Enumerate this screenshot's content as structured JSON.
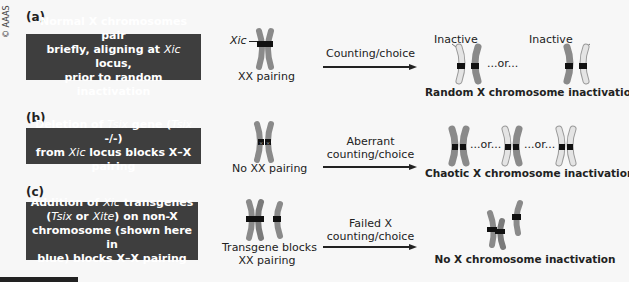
{
  "copyright": "© AAAS",
  "colors": {
    "box_bg": "#3e3e3e",
    "chromosome_dark": "#8a8a8a",
    "chromosome_light": "#e4e4e4",
    "locus": "#111111",
    "background": "#f7f7f7"
  },
  "panels": [
    {
      "label": "(a)",
      "box_lines": [
        "Normal X chromosomes pair",
        "briefly, aligning at Xic locus,",
        "prior to random inactivation"
      ],
      "xic_label": "Xic",
      "pair_caption": "XX pairing",
      "arrow_label": "Counting/choice",
      "outcome_labels": [
        "Inactive",
        "Inactive"
      ],
      "or_text": "...or...",
      "result": "Random X chromosome inactivation"
    },
    {
      "label": "(b)",
      "box_lines": [
        "Deletion of Tsix gene (Tsix -/-)",
        "from Xic locus blocks X–X pairing"
      ],
      "pair_caption": "No XX pairing",
      "arrow_label_lines": [
        "Aberrant",
        "counting/choice"
      ],
      "or_text_1": "...or...",
      "or_text_2": "...or...",
      "result": "Chaotic X chromosome inactivation"
    },
    {
      "label": "(c)",
      "box_lines": [
        "Addition of Xic transgenes",
        "(Tsix or Xite) on non-X",
        "chromosome (shown here in",
        "blue) blocks X–X pairing"
      ],
      "pair_caption_lines": [
        "Transgene blocks",
        "XX pairing"
      ],
      "arrow_label_lines": [
        "Failed X",
        "counting/choice"
      ],
      "result": "No X chromosome inactivation"
    }
  ]
}
